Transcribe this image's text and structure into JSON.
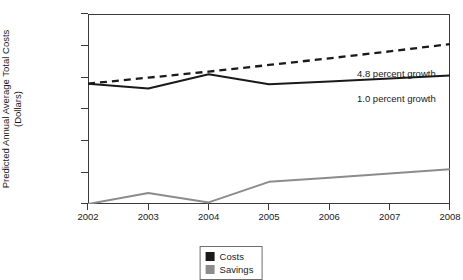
{
  "chart_data": {
    "type": "line",
    "title": "",
    "xlabel": "",
    "ylabel_line1": "Predicted Annual Average Total Costs",
    "ylabel_line2": "(Dollars)",
    "categories": [
      "2002",
      "2003",
      "2004",
      "2005",
      "2006",
      "2007",
      "2008"
    ],
    "x": [
      2002,
      2003,
      2004,
      2005,
      2006,
      2007,
      2008
    ],
    "ylim": [
      0,
      6000
    ],
    "xlim": [
      2002,
      2008
    ],
    "yticks": [
      0,
      1000,
      2000,
      3000,
      4000,
      5000,
      6000
    ],
    "ytick_labels": [
      "0",
      "1,000",
      "2,000",
      "3,000",
      "4,000",
      "5,000",
      "6,000"
    ],
    "grid": false,
    "legend_position": "bottom-center",
    "series": [
      {
        "name": "Costs",
        "style": "solid",
        "color": "#1a1a1a",
        "values": [
          3800,
          3650,
          4100,
          3780,
          3870,
          3960,
          4060
        ]
      },
      {
        "name": "Projected growth trend",
        "style": "dashed",
        "color": "#1a1a1a",
        "values": [
          3800,
          3990,
          4180,
          4390,
          4600,
          4820,
          5050
        ]
      },
      {
        "name": "Savings",
        "style": "solid",
        "color": "#8c8c8c",
        "values": [
          0,
          350,
          50,
          700,
          830,
          960,
          1100
        ]
      }
    ],
    "annotations": [
      {
        "text": "4.8 percent growth",
        "x": 357,
        "y": 68
      },
      {
        "text": "1.0 percent growth",
        "x": 357,
        "y": 93
      }
    ],
    "legend": [
      {
        "label": "Costs",
        "color": "#1a1a1a"
      },
      {
        "label": "Savings",
        "color": "#8c8c8c"
      }
    ]
  }
}
